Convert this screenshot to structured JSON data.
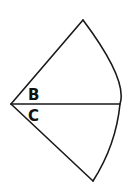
{
  "diagram": {
    "type": "circular-sector",
    "apex": [
      11,
      104
    ],
    "top_vertex": [
      83,
      20
    ],
    "bottom_vertex": [
      93,
      181
    ],
    "divider_end": [
      120,
      104
    ],
    "stroke_color": "#1a1a1a",
    "background": "#ffffff",
    "labels": {
      "upper_angle": "B",
      "lower_angle": "C"
    }
  }
}
